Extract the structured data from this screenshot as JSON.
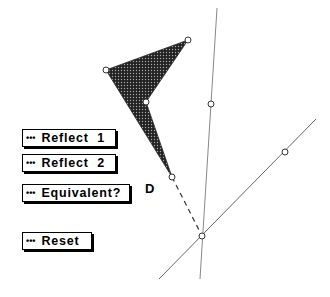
{
  "buttons": [
    {
      "id": "reflect-1",
      "icon": "•••",
      "label": "Reflect  1"
    },
    {
      "id": "reflect-2",
      "icon": "•••",
      "label": "Reflect  2"
    },
    {
      "id": "equivalent",
      "icon": "•••",
      "label": "Equivalent?"
    },
    {
      "id": "reset",
      "icon": "•••",
      "label": "Reset"
    }
  ],
  "labels": {
    "point_d": "D"
  },
  "colors": {
    "fill": "#3a3a3a",
    "line": "#777777"
  }
}
